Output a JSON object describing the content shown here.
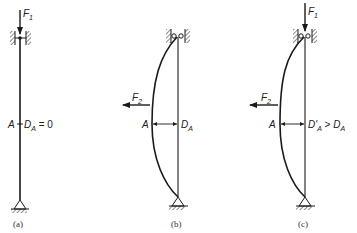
{
  "diagram": {
    "type": "column-buckling-diagram",
    "panels": [
      {
        "id": "a",
        "caption": "(a)",
        "force_top": "F",
        "force_top_sub": "1",
        "point_label": "A",
        "deflection_label": "D",
        "deflection_sub": "A",
        "deflection_relation": " = 0"
      },
      {
        "id": "b",
        "caption": "(b)",
        "force_side": "F",
        "force_side_sub": "2",
        "point_label": "A",
        "deflection_label": "D",
        "deflection_sub": "A"
      },
      {
        "id": "c",
        "caption": "(c)",
        "force_top": "F",
        "force_top_sub": "1",
        "force_side": "F",
        "force_side_sub": "2",
        "point_label": "A",
        "deflection_label": "D'",
        "deflection_sub": "A",
        "deflection_relation": " > ",
        "compare_label": "D",
        "compare_sub": "A"
      }
    ],
    "colors": {
      "line": "#1a1a1a",
      "background": "#ffffff"
    }
  }
}
